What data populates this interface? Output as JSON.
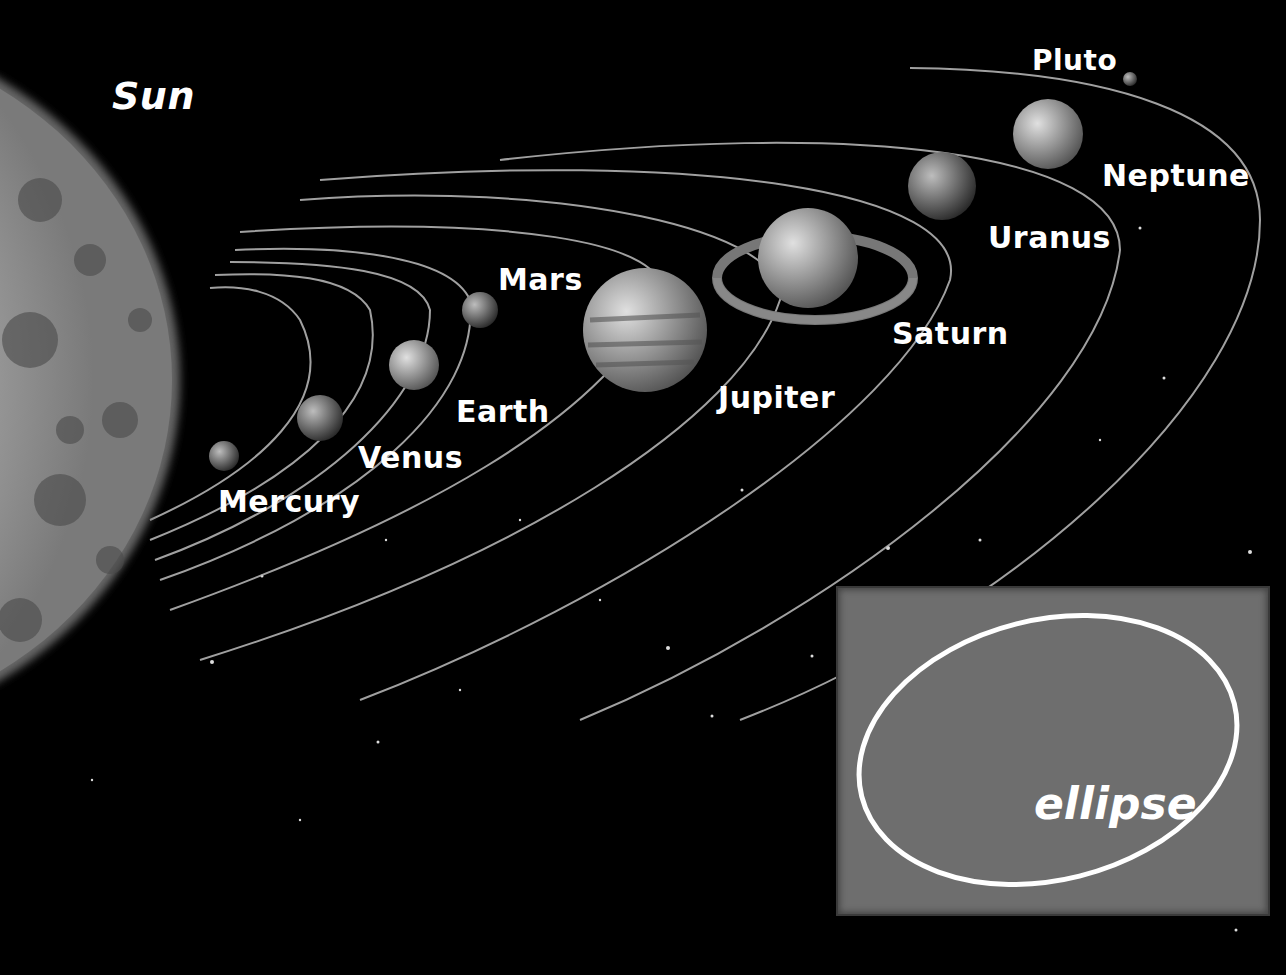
{
  "diagram": {
    "sun_label": "Sun",
    "planets": [
      {
        "name": "Mercury",
        "label_x": 218,
        "label_y": 484
      },
      {
        "name": "Venus",
        "label_x": 358,
        "label_y": 440
      },
      {
        "name": "Earth",
        "label_x": 456,
        "label_y": 394
      },
      {
        "name": "Mars",
        "label_x": 498,
        "label_y": 262
      },
      {
        "name": "Jupiter",
        "label_x": 718,
        "label_y": 380
      },
      {
        "name": "Saturn",
        "label_x": 892,
        "label_y": 316
      },
      {
        "name": "Uranus",
        "label_x": 988,
        "label_y": 220
      },
      {
        "name": "Neptune",
        "label_x": 1102,
        "label_y": 158
      },
      {
        "name": "Pluto",
        "label_x": 1032,
        "label_y": 44
      }
    ],
    "inset": {
      "label": "ellipse",
      "background": "#6e6e6e",
      "stroke": "#ffffff"
    },
    "colors": {
      "background": "#000000",
      "text": "#ffffff",
      "orbit": "#bdbdbd"
    }
  }
}
